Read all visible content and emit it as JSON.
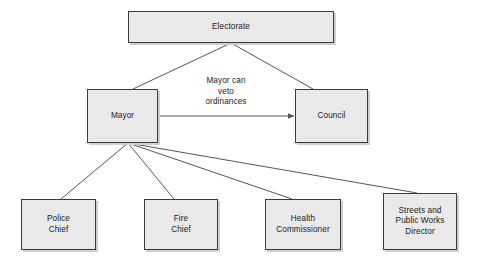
{
  "diagram": {
    "background_color": "#ffffff",
    "node_fill_color": "#e9e9e9",
    "node_border_color": "#3a3a3a",
    "edge_color": "#555555",
    "text_color": "#1a1a1a",
    "nodes": [
      {
        "id": "electorate",
        "label": "Electorate",
        "x": 128,
        "y": 11,
        "w": 206,
        "h": 32
      },
      {
        "id": "mayor",
        "label": "Mayor",
        "x": 87,
        "y": 89,
        "w": 71,
        "h": 54
      },
      {
        "id": "council",
        "label": "Council",
        "x": 295,
        "y": 89,
        "w": 73,
        "h": 54
      },
      {
        "id": "police-chief",
        "label": "Police\nChief",
        "x": 21,
        "y": 199,
        "w": 75,
        "h": 51
      },
      {
        "id": "fire-chief",
        "label": "Fire\nChief",
        "x": 144,
        "y": 199,
        "w": 74,
        "h": 51
      },
      {
        "id": "health-commissioner",
        "label": "Health\nCommissioner",
        "x": 265,
        "y": 199,
        "w": 76,
        "h": 51
      },
      {
        "id": "streets-public-works-director",
        "label": "Streets and\nPublic Works\nDirector",
        "x": 383,
        "y": 193,
        "w": 74,
        "h": 57
      }
    ],
    "edges": [
      {
        "id": "electorate-to-mayor",
        "from": "electorate",
        "to": "mayor",
        "x1": 231,
        "y1": 43,
        "x2": 133,
        "y2": 89,
        "arrow": false
      },
      {
        "id": "electorate-to-council",
        "from": "electorate",
        "to": "council",
        "x1": 231,
        "y1": 43,
        "x2": 313,
        "y2": 89,
        "arrow": false
      },
      {
        "id": "mayor-to-council-veto",
        "from": "mayor",
        "to": "council",
        "x1": 158,
        "y1": 116,
        "x2": 294,
        "y2": 116,
        "arrow": true
      },
      {
        "id": "mayor-to-police-chief",
        "from": "mayor",
        "to": "police-chief",
        "x1": 128,
        "y1": 143,
        "x2": 61,
        "y2": 199,
        "arrow": false
      },
      {
        "id": "mayor-to-fire-chief",
        "from": "mayor",
        "to": "fire-chief",
        "x1": 128,
        "y1": 143,
        "x2": 174,
        "y2": 199,
        "arrow": false
      },
      {
        "id": "mayor-to-health-commissioner",
        "from": "mayor",
        "to": "health-commissioner",
        "x1": 128,
        "y1": 143,
        "x2": 292,
        "y2": 199,
        "arrow": false
      },
      {
        "id": "mayor-to-streets-director",
        "from": "mayor",
        "to": "streets-public-works-director",
        "x1": 128,
        "y1": 143,
        "x2": 417,
        "y2": 193,
        "arrow": false
      }
    ],
    "edge_labels": [
      {
        "id": "veto-label",
        "for_edge": "mayor-to-council-veto",
        "text": "Mayor can\nveto\nordinances",
        "x": 186,
        "y": 76,
        "w": 80
      }
    ]
  }
}
